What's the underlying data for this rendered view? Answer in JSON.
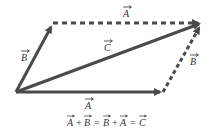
{
  "diagram": {
    "colors": {
      "vector": "#4a4a4a",
      "text": "#333333",
      "background": "#ffffff"
    },
    "points": {
      "origin": [
        16,
        92
      ],
      "b_tip": [
        53,
        23
      ],
      "a_tip": [
        163,
        92
      ],
      "c_tip": [
        202,
        22
      ]
    },
    "vectors": [
      {
        "id": "A_bottom",
        "label": "A",
        "from": "origin",
        "to": "a_tip",
        "style": "solid"
      },
      {
        "id": "B_left",
        "label": "B",
        "from": "origin",
        "to": "b_tip",
        "style": "solid"
      },
      {
        "id": "C_resultant",
        "label": "C",
        "from": "origin",
        "to": "c_tip",
        "style": "solid"
      },
      {
        "id": "A_top",
        "label": "A",
        "from": "b_tip",
        "to": "c_tip",
        "style": "dashed"
      },
      {
        "id": "B_right",
        "label": "B",
        "from": "a_tip",
        "to": "c_tip",
        "style": "dashed"
      }
    ],
    "labels": {
      "a_top": "A",
      "b_left": "B",
      "c_mid": "C",
      "b_right": "B",
      "a_bottom": "A"
    },
    "equation": {
      "terms": [
        "A",
        "+",
        "B",
        "=",
        "B",
        "+",
        "A",
        "=",
        "C"
      ],
      "text": "A + B = B + A = C"
    }
  }
}
